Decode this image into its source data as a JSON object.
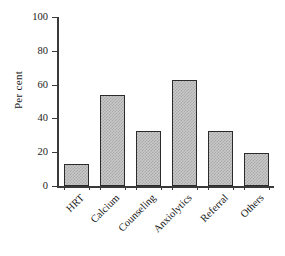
{
  "chart_data": {
    "type": "bar",
    "title": "",
    "subtitle": "",
    "xlabel": "",
    "ylabel": "Per cent",
    "categories": [
      "HRT",
      "Calcium",
      "Counseling",
      "Anxiolytics",
      "Referral",
      "Others"
    ],
    "values": [
      13,
      54,
      32.5,
      63,
      32.5,
      19.5
    ],
    "ylim": [
      0,
      100
    ],
    "yticks": [
      0,
      20,
      40,
      60,
      80,
      100
    ],
    "ytick_labels": [
      "0",
      "20",
      "40",
      "60",
      "80",
      "100"
    ],
    "grid": false,
    "legend": null,
    "bar_fill_color": "#c9c9c9",
    "bar_pattern_color": "#a8a8a8",
    "bar_edge_color": "#2b2b2b",
    "axis_color": "#3a3a3a",
    "background_color": "#ffffff",
    "xtick_label_rotation": -45
  },
  "axes": {
    "y_title": "Per cent",
    "y_tick_0": "0",
    "y_tick_1": "20",
    "y_tick_2": "40",
    "y_tick_3": "60",
    "y_tick_4": "80",
    "y_tick_5": "100",
    "x_label_0": "HRT",
    "x_label_1": "Calcium",
    "x_label_2": "Counseling",
    "x_label_3": "Anxiolytics",
    "x_label_4": "Referral",
    "x_label_5": "Others"
  }
}
